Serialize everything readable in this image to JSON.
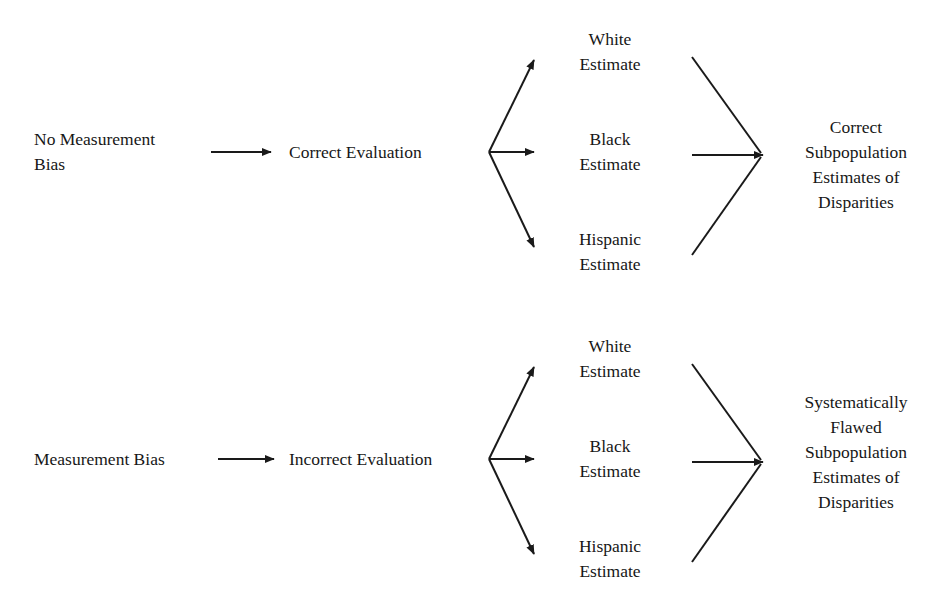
{
  "diagram": {
    "stroke_color": "#1a1a1a",
    "background_color": "#ffffff",
    "text_color": "#171717",
    "rows": [
      {
        "id": "no-bias",
        "source": "No Measurement\nBias",
        "evaluation": "Correct Evaluation",
        "estimates": [
          "White\nEstimate",
          "Black\nEstimate",
          "Hispanic\nEstimate"
        ],
        "outcome": "Correct\nSubpopulation\nEstimates of\nDisparities"
      },
      {
        "id": "bias",
        "source": "Measurement Bias",
        "evaluation": "Incorrect Evaluation",
        "estimates": [
          "White\nEstimate",
          "Black\nEstimate",
          "Hispanic\nEstimate"
        ],
        "outcome": "Systematically\nFlawed\nSubpopulation\nEstimates of\nDisparities"
      }
    ]
  }
}
